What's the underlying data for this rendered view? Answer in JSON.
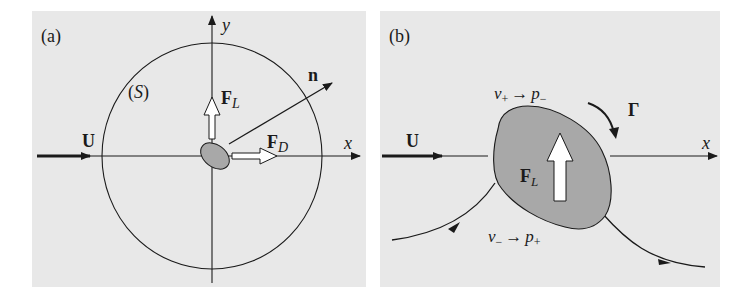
{
  "figure": {
    "panels": [
      {
        "id": "a",
        "label": "(a)",
        "axis_x": "x",
        "axis_y": "y",
        "surface_label_open": "(",
        "surface_label": "S",
        "surface_label_close": ")",
        "freestream": "U",
        "normal": "n",
        "lift": {
          "main": "F",
          "sub": "L"
        },
        "drag": {
          "main": "F",
          "sub": "D"
        }
      },
      {
        "id": "b",
        "label": "(b)",
        "axis_x": "x",
        "freestream": "U",
        "circulation": "Γ",
        "lift": {
          "main": "F",
          "sub": "L"
        },
        "upper_relation": {
          "v": "v",
          "v_sub": "+",
          "arrow": "→",
          "p": "p",
          "p_sub": "−"
        },
        "lower_relation": {
          "v": "v",
          "v_sub": "−",
          "arrow": "→",
          "p": "p",
          "p_sub": "+"
        }
      }
    ],
    "colors": {
      "background": "#e8e8e8",
      "body_fill": "#a8a8a8",
      "stroke": "#1a1a1a",
      "force_arrow_fill": "#ffffff"
    }
  }
}
